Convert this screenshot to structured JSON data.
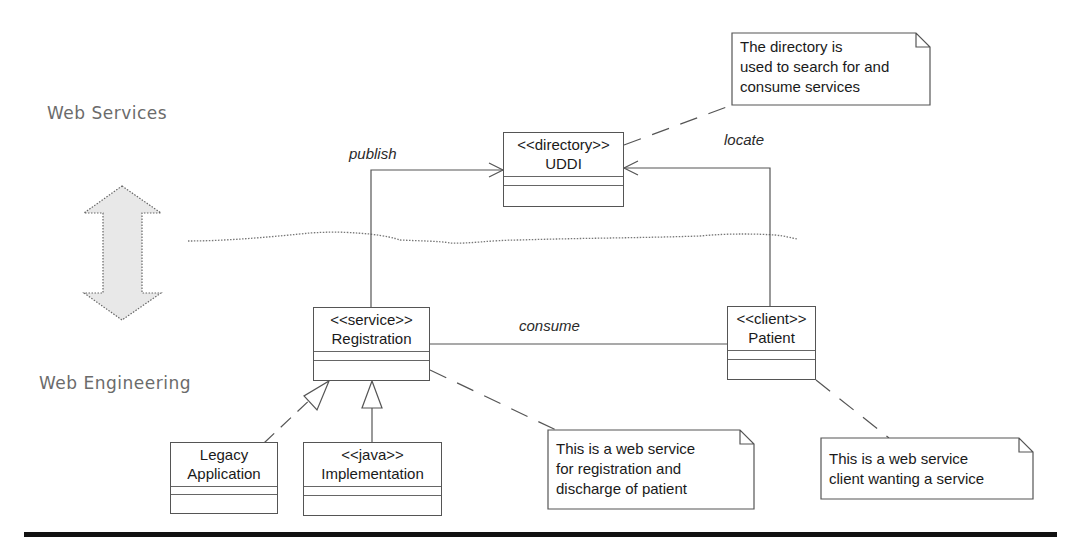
{
  "layers": {
    "top_label": "Web Services",
    "bottom_label": "Web Engineering"
  },
  "classes": {
    "uddi": {
      "stereotype": "<<directory>>",
      "name": "UDDI"
    },
    "registration": {
      "stereotype": "<<service>>",
      "name": "Registration"
    },
    "patient": {
      "stereotype": "<<client>>",
      "name": "Patient"
    },
    "legacy": {
      "line1": "Legacy",
      "line2": "Application"
    },
    "implementation": {
      "stereotype": "<<java>>",
      "name": "Implementation"
    }
  },
  "relations": {
    "publish": "publish",
    "locate": "locate",
    "consume": "consume"
  },
  "notes": {
    "directory_note": "The directory is\nused to search for and\nconsume services",
    "service_note": "This is a web service\nfor registration and\ndischarge of patient",
    "client_note": "This is a web service\nclient wanting a service"
  },
  "colors": {
    "line": "#555555",
    "label_gray": "#6b6b6b",
    "arrow_fill": "#e6e6e6",
    "footer_bar": "#111111"
  }
}
